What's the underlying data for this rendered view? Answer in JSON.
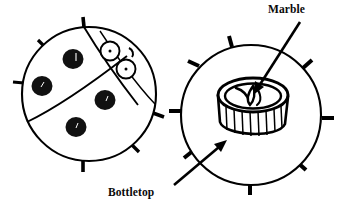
{
  "figure": {
    "title_visible": false,
    "background_color": "#ffffff",
    "ink_color": "#000000",
    "type": "line-drawing-diagram",
    "panels": [
      {
        "name": "ladybug-assembled-view",
        "description": "Circular ladybug craft seen from above with spots, head, eyes and legs",
        "center": [
          90,
          94
        ],
        "radius": 68,
        "spots": 4,
        "eyes": 2,
        "legs": 6
      },
      {
        "name": "ladybug-underside-view",
        "description": "Circular disc with a ridged bottletop containing a marble at its center",
        "center": [
          252,
          112
        ],
        "radius": 72,
        "legs": 8,
        "bottletop_ridges": 9
      }
    ]
  },
  "labels": {
    "marble": "Marble",
    "bottletop": "Bottletop"
  },
  "callouts": [
    {
      "name": "marble-callout",
      "label": "Marble",
      "label_position": [
        268,
        12
      ],
      "arrow_from": [
        300,
        22
      ],
      "arrow_to": [
        252,
        92
      ],
      "points_at": "marble inside bottletop"
    },
    {
      "name": "bottletop-callout",
      "label": "Bottletop",
      "label_position": [
        108,
        190
      ],
      "arrow_from": [
        174,
        184
      ],
      "arrow_to": [
        226,
        140
      ],
      "points_at": "ridged bottletop rim"
    }
  ],
  "colors": {
    "ink": "#000000",
    "paper": "#ffffff",
    "spot_fill": "#111111"
  }
}
